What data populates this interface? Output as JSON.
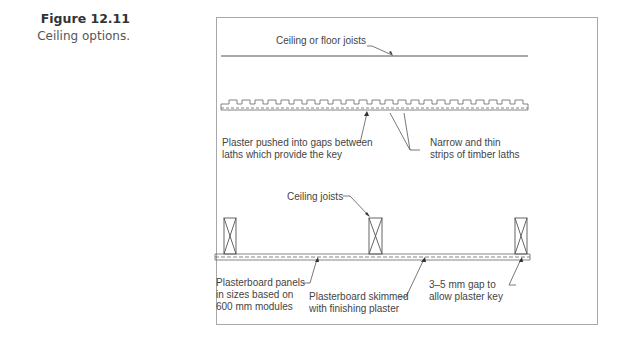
{
  "figure": {
    "number": "Figure 12.11",
    "title": "Ceiling options."
  },
  "diagram": {
    "top_section": {
      "joist_label": "Ceiling or floor joists"
    },
    "lath_section": {
      "plaster_label_line1": "Plaster pushed into gaps between",
      "plaster_label_line2": "laths which provide the key",
      "laths_label_line1": "Narrow and thin",
      "laths_label_line2": "strips of timber laths"
    },
    "plasterboard_section": {
      "joists_label": "Ceiling joists",
      "panels_label_line1": "Plasterboard panels",
      "panels_label_line2": "in sizes based on",
      "panels_label_line3": "600 mm modules",
      "skim_label_line1": "Plasterboard skimmed",
      "skim_label_line2": "with finishing plaster",
      "gap_label_line1": "3–5 mm  gap to",
      "gap_label_line2": "allow plaster key"
    },
    "colors": {
      "line": "#555555",
      "frame": "#a8a8a8",
      "text": "#444444"
    }
  }
}
